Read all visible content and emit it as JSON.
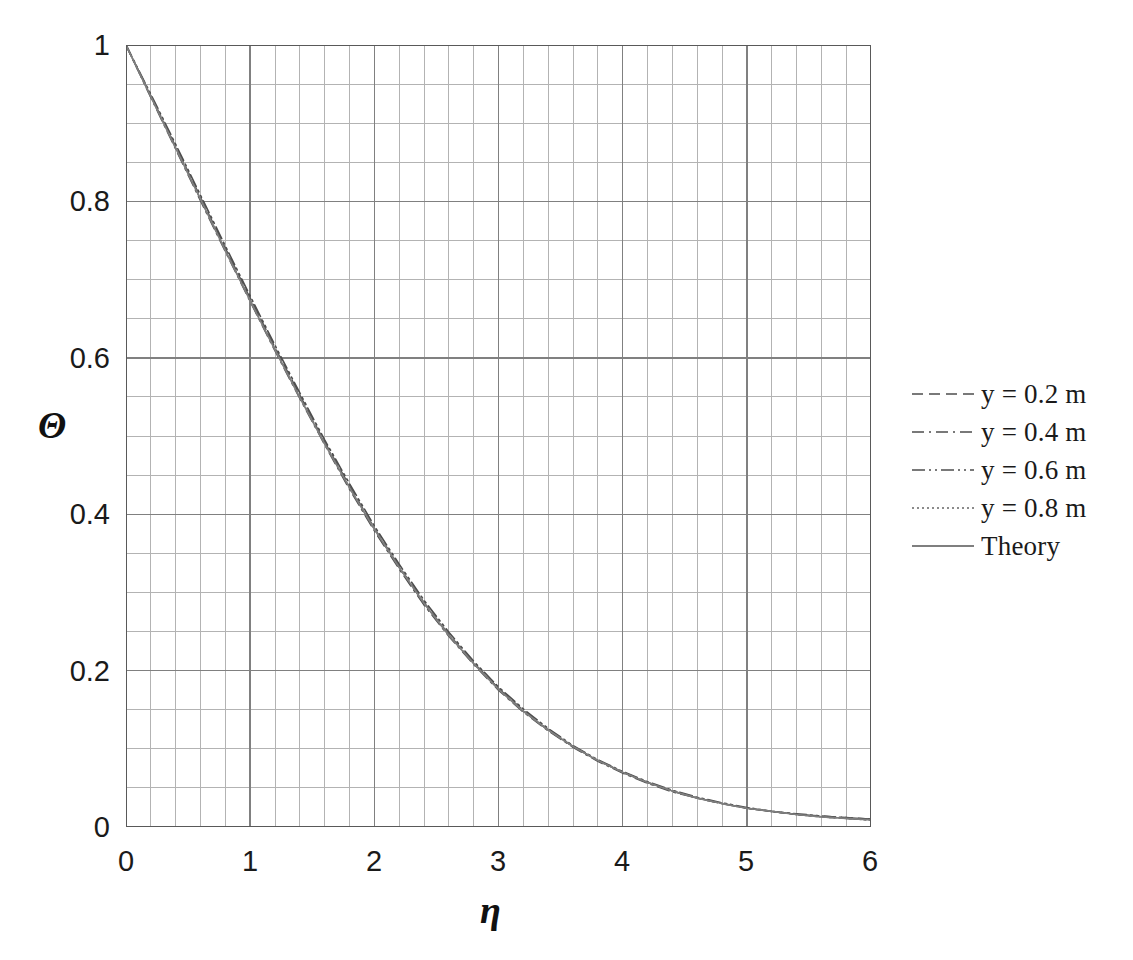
{
  "chart_data": {
    "type": "line",
    "title": "",
    "subtitle": "",
    "xlabel": "η",
    "ylabel": "Θ",
    "xlim": [
      0,
      6
    ],
    "ylim": [
      0,
      1
    ],
    "x_ticks": [
      "0",
      "1",
      "2",
      "3",
      "4",
      "5",
      "6"
    ],
    "x_tick_values": [
      0,
      1,
      2,
      3,
      4,
      5,
      6
    ],
    "y_ticks": [
      "0",
      "0.2",
      "0.4",
      "0.6",
      "0.8",
      "1"
    ],
    "y_tick_values": [
      0,
      0.2,
      0.4,
      0.6,
      0.8,
      1
    ],
    "grid": true,
    "grid_major_x_step": 1,
    "grid_minor_x_step": 0.2,
    "grid_major_y_step": 0.2,
    "grid_minor_y_step": 0.05,
    "grid_major_color": "#808080",
    "grid_minor_color": "#b3b3b3",
    "legend_position": "right",
    "x": [
      0,
      0.2,
      0.4,
      0.6,
      0.8,
      1.0,
      1.2,
      1.4,
      1.6,
      1.8,
      2.0,
      2.2,
      2.4,
      2.6,
      2.8,
      3.0,
      3.2,
      3.4,
      3.6,
      3.8,
      4.0,
      4.2,
      4.4,
      4.6,
      4.8,
      5.0,
      5.2,
      5.4,
      5.6,
      5.8,
      6.0
    ],
    "series": [
      {
        "name": "y = 0.2 m",
        "style": "dashed",
        "color": "#4d4d4d",
        "values": [
          1.0,
          0.935,
          0.87,
          0.805,
          0.74,
          0.676,
          0.613,
          0.552,
          0.492,
          0.436,
          0.382,
          0.333,
          0.287,
          0.246,
          0.21,
          0.177,
          0.149,
          0.124,
          0.103,
          0.085,
          0.07,
          0.057,
          0.046,
          0.037,
          0.03,
          0.024,
          0.02,
          0.016,
          0.014,
          0.012,
          0.01
        ]
      },
      {
        "name": "y = 0.4 m",
        "style": "dash-dot",
        "color": "#4d4d4d",
        "values": [
          1.0,
          0.933,
          0.867,
          0.801,
          0.736,
          0.672,
          0.609,
          0.548,
          0.489,
          0.432,
          0.379,
          0.33,
          0.284,
          0.244,
          0.208,
          0.175,
          0.147,
          0.123,
          0.102,
          0.084,
          0.069,
          0.056,
          0.045,
          0.037,
          0.03,
          0.024,
          0.02,
          0.016,
          0.013,
          0.011,
          0.009
        ]
      },
      {
        "name": "y = 0.6 m",
        "style": "dash-dot-dot",
        "color": "#4d4d4d",
        "values": [
          1.0,
          0.937,
          0.873,
          0.808,
          0.743,
          0.679,
          0.616,
          0.555,
          0.495,
          0.439,
          0.385,
          0.336,
          0.29,
          0.249,
          0.212,
          0.179,
          0.151,
          0.126,
          0.104,
          0.086,
          0.071,
          0.058,
          0.047,
          0.038,
          0.031,
          0.025,
          0.02,
          0.017,
          0.014,
          0.012,
          0.01
        ]
      },
      {
        "name": "y = 0.8 m",
        "style": "dotted",
        "color": "#666666",
        "values": [
          1.0,
          0.934,
          0.869,
          0.803,
          0.738,
          0.674,
          0.611,
          0.55,
          0.491,
          0.434,
          0.381,
          0.332,
          0.286,
          0.246,
          0.209,
          0.177,
          0.148,
          0.124,
          0.103,
          0.085,
          0.07,
          0.057,
          0.046,
          0.037,
          0.03,
          0.024,
          0.02,
          0.016,
          0.013,
          0.011,
          0.009
        ]
      },
      {
        "name": "Theory",
        "style": "solid",
        "color": "#7f7f7f",
        "values": [
          1.0,
          0.934,
          0.868,
          0.803,
          0.737,
          0.673,
          0.61,
          0.549,
          0.49,
          0.434,
          0.381,
          0.332,
          0.286,
          0.245,
          0.209,
          0.176,
          0.148,
          0.124,
          0.103,
          0.085,
          0.07,
          0.057,
          0.046,
          0.037,
          0.03,
          0.024,
          0.02,
          0.016,
          0.013,
          0.011,
          0.009
        ]
      }
    ]
  },
  "axes": {
    "y_title": "Θ",
    "x_title": "η"
  },
  "legend": {
    "items": [
      {
        "label": "y = 0.2 m",
        "style": "dashed"
      },
      {
        "label": "y = 0.4 m",
        "style": "dash-dot"
      },
      {
        "label": "y = 0.6 m",
        "style": "dash-dot-dot"
      },
      {
        "label": "y = 0.8 m",
        "style": "dotted"
      },
      {
        "label": "Theory",
        "style": "solid"
      }
    ]
  }
}
